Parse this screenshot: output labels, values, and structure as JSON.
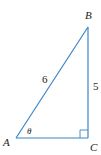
{
  "diagram": {
    "type": "right-triangle",
    "line_color": "#3a86c8",
    "text_color": "#222222",
    "vertices": {
      "A": {
        "label": "A"
      },
      "B": {
        "label": "B"
      },
      "C": {
        "label": "C"
      }
    },
    "sides": {
      "hypotenuse_AB": {
        "label": "6"
      },
      "leg_BC": {
        "label": "5"
      }
    },
    "angle": {
      "vertex": "A",
      "label": "θ"
    },
    "right_angle_at": "C"
  }
}
